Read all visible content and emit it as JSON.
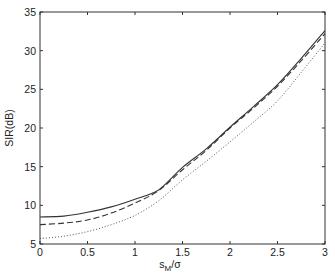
{
  "chart_data": {
    "type": "line",
    "title": "",
    "xlabel": "s_M/σ",
    "xlabel_main": "s",
    "xlabel_sub": "M",
    "xlabel_rest": "/σ",
    "ylabel": "SIR(dB)",
    "xlim": [
      0,
      3
    ],
    "ylim": [
      5,
      35
    ],
    "grid": false,
    "legend": null,
    "xticks": [
      0,
      0.5,
      1,
      1.5,
      2,
      2.5,
      3
    ],
    "xtick_labels": [
      "0",
      "0.5",
      "1",
      "1.5",
      "2",
      "2.5",
      "3"
    ],
    "yticks": [
      5,
      10,
      15,
      20,
      25,
      30,
      35
    ],
    "ytick_labels": [
      "5",
      "10",
      "15",
      "20",
      "25",
      "30",
      "35"
    ],
    "x": [
      0,
      0.25,
      0.5,
      0.75,
      1.0,
      1.25,
      1.5,
      1.75,
      2.0,
      2.25,
      2.5,
      2.75,
      3.0
    ],
    "series": [
      {
        "name": "solid",
        "style": "solid",
        "color": "#333333",
        "values": [
          8.5,
          8.6,
          9.1,
          9.8,
          10.8,
          12.0,
          14.9,
          17.3,
          20.1,
          22.8,
          25.6,
          29.0,
          32.6
        ]
      },
      {
        "name": "dashed",
        "style": "dashed",
        "color": "#333333",
        "values": [
          7.5,
          7.7,
          8.1,
          9.0,
          10.3,
          11.9,
          14.6,
          17.1,
          20.0,
          22.6,
          25.4,
          28.7,
          32.2
        ]
      },
      {
        "name": "dotted",
        "style": "dotted",
        "color": "#555555",
        "values": [
          5.7,
          6.0,
          6.6,
          7.5,
          8.7,
          10.6,
          13.3,
          15.7,
          18.2,
          20.8,
          23.5,
          27.2,
          31.0
        ]
      }
    ]
  }
}
